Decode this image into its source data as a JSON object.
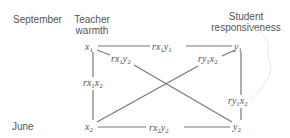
{
  "rows": {
    "top": "September",
    "bottom": "June"
  },
  "columns": {
    "left": [
      "Teacher",
      "warmth"
    ],
    "right": [
      "Student",
      "responsiveness"
    ]
  },
  "nodes": {
    "x1": {
      "var": "x",
      "sub": "1"
    },
    "y1": {
      "var": "y",
      "sub": "1"
    },
    "x2": {
      "var": "x",
      "sub": "2"
    },
    "y2": {
      "var": "y",
      "sub": "2"
    }
  },
  "edges": [
    {
      "id": "rx1y1",
      "prefix": "r",
      "a": "x",
      "a_sub": "1",
      "b": "y",
      "b_sub": "1",
      "from": "x1",
      "to": "y1"
    },
    {
      "id": "rx1y2",
      "prefix": "r",
      "a": "x",
      "a_sub": "1",
      "b": "y",
      "b_sub": "2",
      "from": "x1",
      "to": "y2"
    },
    {
      "id": "ry1x2",
      "prefix": "r",
      "a": "y",
      "a_sub": "1",
      "b": "x",
      "b_sub": "2",
      "from": "y1",
      "to": "x2"
    },
    {
      "id": "rx1x2",
      "prefix": "r",
      "a": "x",
      "a_sub": "1",
      "b": "x",
      "b_sub": "2",
      "from": "x1",
      "to": "x2"
    },
    {
      "id": "ry1y2",
      "prefix": "r",
      "a": "y",
      "a_sub": "1",
      "b": "x",
      "b_sub": "2",
      "from": "y1",
      "to": "y2"
    },
    {
      "id": "rx2y2",
      "prefix": "r",
      "a": "x",
      "a_sub": "2",
      "b": "y",
      "b_sub": "2",
      "from": "x2",
      "to": "y2"
    }
  ],
  "colors": {
    "line": "#777777",
    "text": "#555555",
    "faint_curve": "#e6e6e6"
  }
}
